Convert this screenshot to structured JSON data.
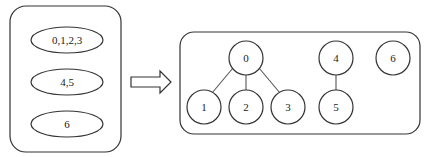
{
  "left_panel": {
    "sets": [
      {
        "label": "0,1,2,3"
      },
      {
        "label": "4,5"
      },
      {
        "label": "6"
      }
    ]
  },
  "arrow": {
    "direction": "right"
  },
  "right_panel": {
    "nodes": [
      {
        "id": "0",
        "label": "0"
      },
      {
        "id": "1",
        "label": "1"
      },
      {
        "id": "2",
        "label": "2"
      },
      {
        "id": "3",
        "label": "3"
      },
      {
        "id": "4",
        "label": "4"
      },
      {
        "id": "5",
        "label": "5"
      },
      {
        "id": "6",
        "label": "6"
      }
    ],
    "edges": [
      {
        "from": "0",
        "to": "1"
      },
      {
        "from": "0",
        "to": "2"
      },
      {
        "from": "0",
        "to": "3"
      },
      {
        "from": "4",
        "to": "5"
      }
    ]
  }
}
